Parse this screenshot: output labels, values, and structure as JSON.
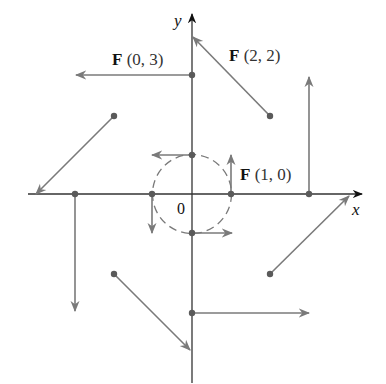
{
  "diagram": {
    "axes": {
      "x_label": "x",
      "y_label": "y",
      "origin_label": "0"
    },
    "labels": [
      {
        "id": "f03",
        "name": "F",
        "args": "(0, 3)"
      },
      {
        "id": "f22",
        "name": "F",
        "args": "(2, 2)"
      },
      {
        "id": "f10",
        "name": "F",
        "args": "(1, 0)"
      }
    ],
    "unit_circle": {
      "radius": 1,
      "style": "dashed"
    },
    "vectors": [
      {
        "point": [
          0,
          1
        ],
        "vector": [
          -1,
          0
        ]
      },
      {
        "point": [
          1,
          0
        ],
        "vector": [
          0,
          1
        ]
      },
      {
        "point": [
          0,
          -1
        ],
        "vector": [
          1,
          0
        ]
      },
      {
        "point": [
          -1,
          0
        ],
        "vector": [
          0,
          -1
        ]
      },
      {
        "point": [
          0,
          3
        ],
        "vector": [
          -3,
          0
        ]
      },
      {
        "point": [
          3,
          0
        ],
        "vector": [
          0,
          3
        ]
      },
      {
        "point": [
          0,
          -3
        ],
        "vector": [
          3,
          0
        ]
      },
      {
        "point": [
          -3,
          0
        ],
        "vector": [
          0,
          -3
        ]
      },
      {
        "point": [
          2,
          2
        ],
        "vector": [
          -2,
          2
        ]
      },
      {
        "point": [
          -2,
          2
        ],
        "vector": [
          -2,
          -2
        ]
      },
      {
        "point": [
          -2,
          -2
        ],
        "vector": [
          2,
          -2
        ]
      },
      {
        "point": [
          2,
          -2
        ],
        "vector": [
          2,
          2
        ]
      }
    ],
    "colors": {
      "axis": "#333333",
      "vector": "#7a7a7a",
      "point": "#5a5a5a",
      "circle": "#7a7a7a"
    }
  }
}
